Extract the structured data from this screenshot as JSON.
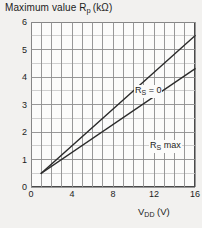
{
  "chart_data": {
    "type": "line",
    "title_parts": {
      "main": "Maximum value R",
      "sub": "p",
      "unit": "(kΩ)"
    },
    "xlabel": "VDD (V)",
    "xlabel_parts": {
      "main": "V",
      "sub": "DD",
      "unit": "(V)"
    },
    "ylabel": "Maximum value Rp (kΩ)",
    "xlim": [
      0,
      16
    ],
    "ylim": [
      0,
      6
    ],
    "xticks": [
      0,
      4,
      8,
      12,
      16
    ],
    "xtick_labels": [
      "0",
      "4",
      "8",
      "12",
      "16"
    ],
    "yticks": [
      0,
      1,
      2,
      3,
      4,
      5,
      6
    ],
    "ytick_labels": [
      "0",
      "1",
      "2",
      "3",
      "4",
      "5",
      "6"
    ],
    "grid": true,
    "grid_major_x_step": 1,
    "grid_major_y_step": 1,
    "grid_minor_y_step": 0.5,
    "legend_position": "inline-annotations",
    "series": [
      {
        "name": "RS = 0",
        "name_parts": {
          "main": "R",
          "sub": "S",
          "tail": " = 0"
        },
        "x": [
          1,
          16
        ],
        "values": [
          0.5,
          5.5
        ],
        "color": "#2b2b2b"
      },
      {
        "name": "RS max",
        "name_parts": {
          "main": "R",
          "sub": "S",
          "tail": " max"
        },
        "x": [
          1,
          16
        ],
        "values": [
          0.5,
          4.3
        ],
        "color": "#2b2b2b"
      }
    ]
  },
  "colors": {
    "background": "#f2f1ef",
    "plot_background": "#fbfbfa",
    "axis": "#4a4a4a",
    "grid_major": "#8d8d8d",
    "grid_minor": "#c4c4c4",
    "curve": "#2b2b2b",
    "text": "#1c1c1c"
  }
}
